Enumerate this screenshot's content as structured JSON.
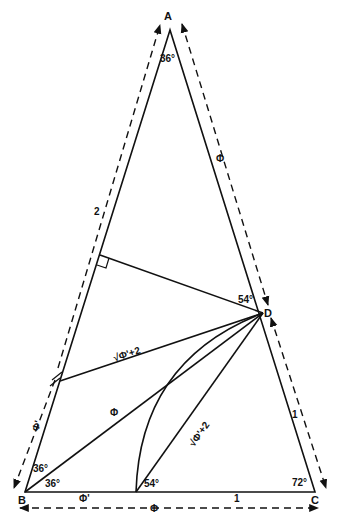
{
  "diagram": {
    "type": "golden-triangle-construction",
    "vertices": {
      "A": {
        "label": "A",
        "angle": "36°"
      },
      "B": {
        "label": "B",
        "angle_upper": "36°",
        "angle_lower": "36°"
      },
      "C": {
        "label": "C",
        "angle": "72°"
      },
      "D": {
        "label": "D",
        "angle": "54°"
      },
      "E": {
        "angle": "54°"
      }
    },
    "lengths": {
      "AB_outer": "2",
      "AD_outer": "Φ",
      "DC_outer": "1",
      "BC_outer": "Φ",
      "BE_inner": "Φ'",
      "EC_inner": "1",
      "B_lower_outer": "Φ'",
      "B_upper_outer": "Φ",
      "FD": "√Φ'+2",
      "ED": "√Φ'+2",
      "BD": "Φ"
    },
    "colors": {
      "stroke": "#111111",
      "background": "#ffffff"
    }
  }
}
